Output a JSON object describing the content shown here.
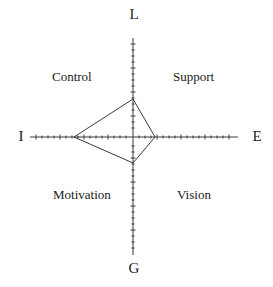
{
  "figure": {
    "type": "quadrant-kite-diagram",
    "background_color": "#ffffff",
    "line_color": "#3a3a3a",
    "text_color": "#1a1a1a",
    "width": 273,
    "height": 287
  },
  "axes": {
    "horizontal": {
      "name": "I-E axis",
      "x_start": 30,
      "x_end": 238,
      "y": 137,
      "tick_spacing": 6,
      "tick_length": 3
    },
    "vertical": {
      "name": "L-G axis",
      "x": 133,
      "y_start": 38,
      "y_end": 255,
      "tick_spacing": 6,
      "tick_length": 3
    },
    "origin": {
      "x": 133,
      "y": 137
    },
    "endpoint_labels": {
      "top": "L",
      "right": "E",
      "bottom": "G",
      "left": "I"
    }
  },
  "quadrants": [
    {
      "key": "upper-left",
      "label": "Control"
    },
    {
      "key": "upper-right",
      "label": "Support"
    },
    {
      "key": "lower-left",
      "label": "Motivation"
    },
    {
      "key": "lower-right",
      "label": "Vision"
    }
  ],
  "chart_data": {
    "type": "line",
    "title": "",
    "xlabel": "",
    "ylabel": "",
    "grid": false,
    "legend": "none",
    "axis_endpoints": {
      "top": "L",
      "right": "E",
      "bottom": "G",
      "left": "I"
    },
    "quadrant_labels": [
      "Control",
      "Support",
      "Motivation",
      "Vision"
    ],
    "categories": [
      "L",
      "E",
      "G",
      "I"
    ],
    "values": [
      38,
      22,
      26,
      59
    ],
    "series": [
      {
        "name": "profile",
        "points": [
          {
            "axis": "L",
            "label": "Leadership",
            "px": {
              "x": 133,
              "y": 99
            },
            "magnitude": 38
          },
          {
            "axis": "E",
            "label": "Extroversion",
            "px": {
              "x": 155,
              "y": 137
            },
            "magnitude": 22
          },
          {
            "axis": "G",
            "label": "Goal",
            "px": {
              "x": 133,
              "y": 163
            },
            "magnitude": 26
          },
          {
            "axis": "I",
            "label": "Introversion",
            "px": {
              "x": 74,
              "y": 137
            },
            "magnitude": 59
          }
        ],
        "polygon_points": "133,99 155,137 133,163 74,137",
        "closed": true,
        "fill": "none",
        "stroke": "#3a3a3a"
      }
    ]
  }
}
